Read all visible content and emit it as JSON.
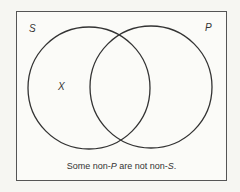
{
  "diagram": {
    "type": "venn",
    "sets": [
      {
        "name": "S",
        "position": "left"
      },
      {
        "name": "P",
        "position": "right"
      }
    ],
    "marks": [
      {
        "symbol": "X",
        "region": "S only (S and not P)"
      }
    ],
    "labels": {
      "set_left": "S",
      "set_right": "P",
      "mark": "X"
    },
    "caption": {
      "part1": "Some non-",
      "part2": "P",
      "part3": " are not non-",
      "part4": "S",
      "part5": "."
    },
    "colors": {
      "stroke": "#333333",
      "background": "#fbfbf8",
      "frame": "#555555"
    }
  }
}
